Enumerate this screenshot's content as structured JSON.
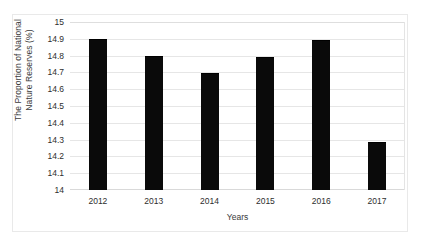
{
  "chart_data": {
    "type": "bar",
    "title": "",
    "xlabel": "Years",
    "ylabel": "The Proportion of National Nature Reserves (%)",
    "ylabel_lines": [
      "The Proportion of National",
      "Nature Reserves (%)"
    ],
    "categories": [
      "2012",
      "2013",
      "2014",
      "2015",
      "2016",
      "2017"
    ],
    "values": [
      14.9,
      14.8,
      14.695,
      14.79,
      14.89,
      14.285
    ],
    "ylim": [
      14,
      15
    ],
    "ytick_labels": [
      "14",
      "14.1",
      "14.2",
      "14.3",
      "14.4",
      "14.5",
      "14.6",
      "14.7",
      "14.8",
      "14.9",
      "15"
    ],
    "ytick_values": [
      14,
      14.1,
      14.2,
      14.3,
      14.4,
      14.5,
      14.6,
      14.7,
      14.8,
      14.9,
      15
    ],
    "grid": true,
    "legend": false,
    "bar_color": "#0a0a0a",
    "grid_color": "#e6e6e6",
    "background_color": "#ffffff",
    "text_color": "#2e2e2e"
  }
}
